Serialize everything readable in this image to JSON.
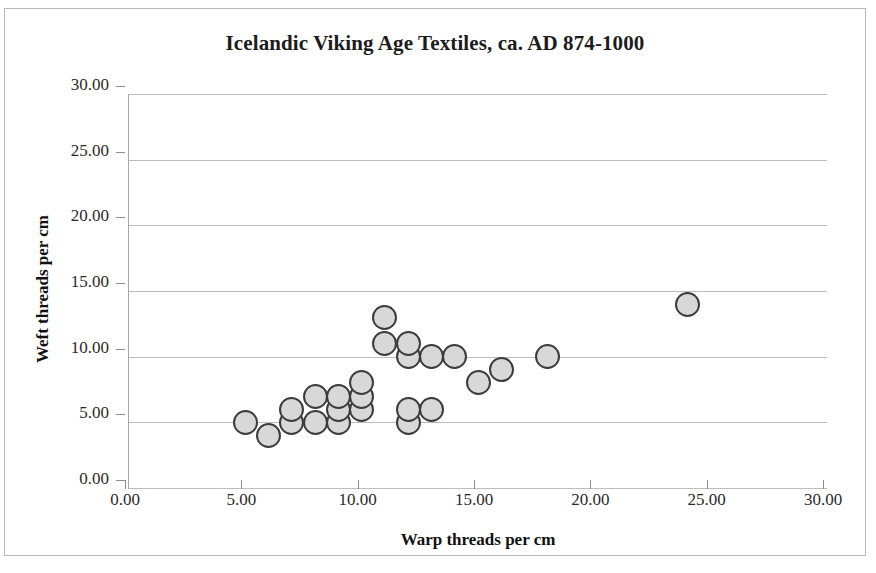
{
  "chart_data": {
    "type": "scatter",
    "title": "Icelandic Viking Age Textiles, ca. AD 874-1000",
    "xlabel": "Warp threads per cm",
    "ylabel": "Weft threads per cm",
    "xlim": [
      0,
      30
    ],
    "ylim": [
      0,
      30
    ],
    "x_ticks": [
      "0.00",
      "5.00",
      "10.00",
      "15.00",
      "20.00",
      "25.00",
      "30.00"
    ],
    "y_ticks": [
      "0.00",
      "5.00",
      "10.00",
      "15.00",
      "20.00",
      "25.00",
      "30.00"
    ],
    "x_tick_values": [
      0,
      5,
      10,
      15,
      20,
      25,
      30
    ],
    "y_tick_values": [
      0,
      5,
      10,
      15,
      20,
      25,
      30
    ],
    "grid": "horizontal",
    "legend": "none",
    "marker_fill": "#d8d8d8",
    "marker_edge": "#3c3c3c",
    "points": [
      {
        "x": 5,
        "y": 5
      },
      {
        "x": 6,
        "y": 4
      },
      {
        "x": 7,
        "y": 5
      },
      {
        "x": 7,
        "y": 6
      },
      {
        "x": 8,
        "y": 5
      },
      {
        "x": 8,
        "y": 7
      },
      {
        "x": 9,
        "y": 5
      },
      {
        "x": 9,
        "y": 6
      },
      {
        "x": 9,
        "y": 7
      },
      {
        "x": 10,
        "y": 6
      },
      {
        "x": 10,
        "y": 7
      },
      {
        "x": 10,
        "y": 8
      },
      {
        "x": 11,
        "y": 11
      },
      {
        "x": 11,
        "y": 13
      },
      {
        "x": 12,
        "y": 5
      },
      {
        "x": 12,
        "y": 6
      },
      {
        "x": 12,
        "y": 10
      },
      {
        "x": 12,
        "y": 11
      },
      {
        "x": 13,
        "y": 6
      },
      {
        "x": 13,
        "y": 10
      },
      {
        "x": 14,
        "y": 10
      },
      {
        "x": 15,
        "y": 8
      },
      {
        "x": 16,
        "y": 9
      },
      {
        "x": 18,
        "y": 10
      },
      {
        "x": 24,
        "y": 14
      }
    ]
  }
}
